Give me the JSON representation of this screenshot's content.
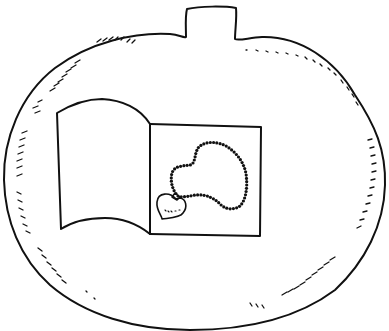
{
  "illustration": {
    "subject": "Pumpkin outline with an open book showing a heart-pendant necklace",
    "style": "black line art coloring page",
    "colors": {
      "background": "#ffffff",
      "ink": "#111111"
    },
    "pumpkin": {
      "stem": {
        "left_x": 186,
        "right_x": 237,
        "top_y": 7,
        "base_y": 38
      },
      "body": {
        "left_x": 4,
        "right_x": 385,
        "top_y": 34,
        "bottom_y": 330
      }
    },
    "book": {
      "left_page": {
        "x": 55,
        "y": 99,
        "width": 95,
        "height": 135
      },
      "right_page": {
        "x": 150,
        "y": 124,
        "width": 111,
        "height": 111
      }
    },
    "necklace": {
      "bead_count": 70,
      "pendant": "heart"
    }
  }
}
